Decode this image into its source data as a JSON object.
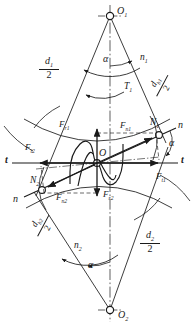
{
  "figure": {
    "type": "engineering-diagram",
    "background": "#ffffff",
    "line_color": "#1a1a1a",
    "width": 194,
    "height": 328
  },
  "centers": {
    "top": {
      "label": "O",
      "sub": "1",
      "x": 110,
      "y": 16
    },
    "bottom": {
      "label": "O",
      "sub": "2",
      "x": 110,
      "y": 310
    },
    "pitch": {
      "label": "O",
      "sub": "",
      "x": 97,
      "y": 163
    }
  },
  "contact_points": {
    "upper": {
      "label": "N",
      "sub": "1",
      "x": 159,
      "y": 136
    },
    "lower": {
      "label": "N",
      "sub": "2",
      "x": 42,
      "y": 188
    }
  },
  "axes": {
    "tangent_left": {
      "label": "t",
      "x": 6,
      "y": 158
    },
    "tangent_right": {
      "label": "t",
      "x": 181,
      "y": 158
    },
    "normal_upper": {
      "label": "n",
      "x": 179,
      "y": 126
    },
    "normal_lower": {
      "label": "n",
      "x": 22,
      "y": 199
    }
  },
  "angles": {
    "top": {
      "label": "α",
      "x": 104,
      "y": 60
    },
    "bottom": {
      "label": "α",
      "x": 92,
      "y": 266
    },
    "right": {
      "label": "α",
      "x": 172,
      "y": 144
    }
  },
  "rotation": {
    "speed_top": {
      "label": "n",
      "sub": "1",
      "x": 144,
      "y": 60
    },
    "speed_bottom": {
      "label": "n",
      "sub": "2",
      "x": 83,
      "y": 248
    },
    "torque_top": {
      "label": "T",
      "sub": "1",
      "x": 126,
      "y": 88
    }
  },
  "radii": {
    "pitch_top": {
      "num": "d",
      "num_sub": "1",
      "den": "2",
      "x": 47,
      "y": 62
    },
    "pitch_bottom": {
      "num": "d",
      "num_sub": "2",
      "den": "2",
      "x": 145,
      "y": 236
    },
    "base_top": {
      "num": "d",
      "num_sub": "b1",
      "den": "2",
      "x": 155,
      "y": 83,
      "rotation": -62
    },
    "base_bottom": {
      "num": "d",
      "num_sub": "b2",
      "den": "2",
      "x": 36,
      "y": 221,
      "rotation": -62
    }
  },
  "forces": {
    "normal_upper": {
      "label": "F",
      "sub": "n1",
      "x": 126,
      "y": 127
    },
    "normal_lower": {
      "label": "F",
      "sub": "n2",
      "x": 62,
      "y": 198
    },
    "radial_upper": {
      "label": "F",
      "sub": "r1",
      "x": 65,
      "y": 126
    },
    "radial_lower": {
      "label": "F",
      "sub": "r2",
      "x": 109,
      "y": 190
    },
    "tangential_left": {
      "label": "F",
      "sub": "t2",
      "x": 31,
      "y": 148
    },
    "tangential_right": {
      "label": "F",
      "sub": "t1",
      "x": 160,
      "y": 177
    }
  }
}
